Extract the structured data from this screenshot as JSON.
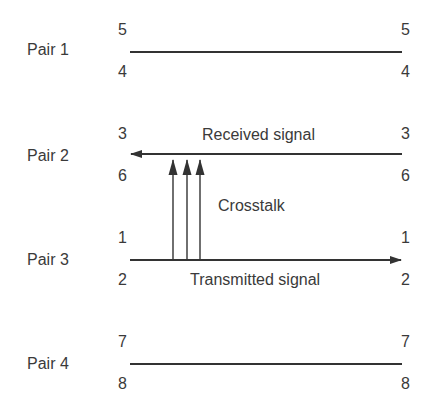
{
  "diagram": {
    "pairs": [
      {
        "label": "Pair 1",
        "top_pin": "5",
        "bottom_pin": "4",
        "direction": "none"
      },
      {
        "label": "Pair 2",
        "top_pin": "3",
        "bottom_pin": "6",
        "direction": "left",
        "signal_label": "Received signal"
      },
      {
        "label": "Pair 3",
        "top_pin": "1",
        "bottom_pin": "2",
        "direction": "right",
        "signal_label": "Transmitted signal"
      },
      {
        "label": "Pair 4",
        "top_pin": "7",
        "bottom_pin": "8",
        "direction": "none"
      }
    ],
    "crosstalk": {
      "label": "Crosstalk",
      "arrow_count": 3,
      "from": "Pair 3",
      "to": "Pair 2"
    },
    "colors": {
      "line": "#333333",
      "text": "#3a3a3a",
      "background": "#ffffff"
    }
  }
}
